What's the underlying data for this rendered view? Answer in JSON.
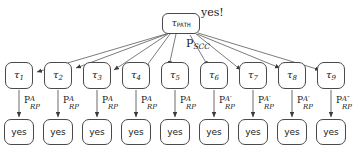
{
  "diagram": {
    "type": "proof-tree",
    "root": {
      "id": "tau-path",
      "label_base": "τ",
      "label_sub": "PATH",
      "annotation": "yes!"
    },
    "root_edge_label": {
      "base": "P",
      "sub": "SCC"
    },
    "tau_nodes": [
      {
        "base": "τ",
        "sub": "1"
      },
      {
        "base": "τ",
        "sub": "2"
      },
      {
        "base": "τ",
        "sub": "3"
      },
      {
        "base": "τ",
        "sub": "4"
      },
      {
        "base": "τ",
        "sub": "5"
      },
      {
        "base": "τ",
        "sub": "6"
      },
      {
        "base": "τ",
        "sub": "7"
      },
      {
        "base": "τ",
        "sub": "8"
      },
      {
        "base": "τ",
        "sub": "9"
      }
    ],
    "rp_edge_labels": [
      {
        "base": "P",
        "sub": "RP",
        "sup": "A"
      },
      {
        "base": "P",
        "sub": "RP",
        "sup": "A"
      },
      {
        "base": "P",
        "sub": "RP",
        "sup": "A"
      },
      {
        "base": "P",
        "sub": "RP",
        "sup": "A"
      },
      {
        "base": "P",
        "sub": "RP",
        "sup": "A"
      },
      {
        "base": "P",
        "sub": "RP",
        "sup": "A′"
      },
      {
        "base": "P",
        "sub": "RP",
        "sup": "A′"
      },
      {
        "base": "P",
        "sub": "RP",
        "sup": "A′"
      },
      {
        "base": "P",
        "sub": "RP",
        "sup": "A″"
      }
    ],
    "leaf_nodes": [
      {
        "label": "yes"
      },
      {
        "label": "yes"
      },
      {
        "label": "yes"
      },
      {
        "label": "yes"
      },
      {
        "label": "yes"
      },
      {
        "label": "yes"
      },
      {
        "label": "yes"
      },
      {
        "label": "yes"
      },
      {
        "label": "yes"
      }
    ],
    "colors": {
      "stroke": "#4a4a4a",
      "text": "#1a1a1a",
      "background": "#ffffff"
    }
  }
}
